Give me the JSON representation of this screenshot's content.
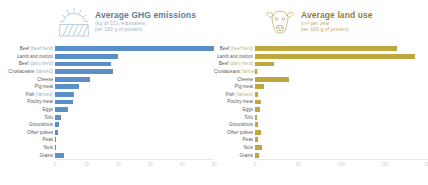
{
  "chart_data": [
    {
      "type": "bar",
      "title": "Average GHG emissions",
      "subtitle_line1": "(kg of CO₂ equivalent",
      "subtitle_line2": "per 100 g of protein)",
      "icon": "sun-over-field-icon",
      "color": "#5b8fc7",
      "orientation": "horizontal",
      "xlabel": "",
      "ylabel": "",
      "xlim": [
        0,
        50
      ],
      "ticks": [
        "0",
        "10",
        "20",
        "30",
        "40",
        "50"
      ],
      "grid": false,
      "legend": "none",
      "categories": [
        {
          "main": "Beef ",
          "paren": "(beef herd)"
        },
        {
          "main": "Lamb and mutton",
          "paren": ""
        },
        {
          "main": "Beef ",
          "paren": "(dairy herd)"
        },
        {
          "main": "Crustaceans ",
          "paren": "(farmed)"
        },
        {
          "main": "Cheese",
          "paren": ""
        },
        {
          "main": "Pig meat",
          "paren": ""
        },
        {
          "main": "Fish ",
          "paren": "(farmed)"
        },
        {
          "main": "Poultry meat",
          "paren": ""
        },
        {
          "main": "Eggs",
          "paren": ""
        },
        {
          "main": "Tofu",
          "paren": ""
        },
        {
          "main": "Groundnuts",
          "paren": ""
        },
        {
          "main": "Other pulses",
          "paren": ""
        },
        {
          "main": "Peas",
          "paren": ""
        },
        {
          "main": "Nuts",
          "paren": ""
        },
        {
          "main": "Grains",
          "paren": ""
        }
      ],
      "values": [
        49.9,
        19.9,
        17.7,
        18.2,
        11.0,
        7.6,
        6.0,
        5.7,
        4.2,
        2.0,
        1.2,
        0.8,
        0.4,
        0.3,
        2.7
      ]
    },
    {
      "type": "bar",
      "title": "Average land use",
      "subtitle_line1": "(m² per year",
      "subtitle_line2": "per 100 g of protein)",
      "icon": "cow-head-icon",
      "color": "#bfa73e",
      "orientation": "horizontal",
      "xlabel": "",
      "ylabel": "",
      "xlim": [
        0,
        200
      ],
      "ticks": [
        "0",
        "50",
        "100",
        "150",
        "200"
      ],
      "grid": false,
      "legend": "none",
      "categories": [
        {
          "main": "Beef ",
          "paren": "(beef herd)"
        },
        {
          "main": "Lamb and mutton",
          "paren": ""
        },
        {
          "main": "Beef ",
          "paren": "(dairy herd)"
        },
        {
          "main": "Crustaceans ",
          "paren": "(farmed)"
        },
        {
          "main": "Cheese",
          "paren": ""
        },
        {
          "main": "Pig meat",
          "paren": ""
        },
        {
          "main": "Fish ",
          "paren": "(farmed)"
        },
        {
          "main": "Poultry meat",
          "paren": ""
        },
        {
          "main": "Eggs",
          "paren": ""
        },
        {
          "main": "Tofu",
          "paren": ""
        },
        {
          "main": "Groundnuts",
          "paren": ""
        },
        {
          "main": "Other pulses",
          "paren": ""
        },
        {
          "main": "Peas",
          "paren": ""
        },
        {
          "main": "Nuts",
          "paren": ""
        },
        {
          "main": "Grains",
          "paren": ""
        }
      ],
      "values": [
        163.6,
        185.0,
        22.0,
        2.0,
        39.8,
        10.7,
        3.7,
        7.1,
        5.7,
        2.2,
        3.5,
        7.3,
        3.4,
        7.9,
        4.6
      ]
    }
  ]
}
